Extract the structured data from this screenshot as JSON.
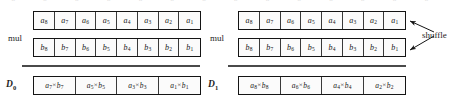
{
  "figure": {
    "ghost_text": "a b a b a b a b a b a b a b",
    "panels": [
      {
        "id": "left",
        "mul_label": "mul",
        "result_label": "D",
        "result_label_sub": "0",
        "operand_rows": [
          {
            "name": "operand-a",
            "cells": [
              {
                "base": "a",
                "sub": "8"
              },
              {
                "base": "a",
                "sub": "7"
              },
              {
                "base": "a",
                "sub": "6"
              },
              {
                "base": "a",
                "sub": "5"
              },
              {
                "base": "a",
                "sub": "4"
              },
              {
                "base": "a",
                "sub": "3"
              },
              {
                "base": "a",
                "sub": "2"
              },
              {
                "base": "a",
                "sub": "1"
              }
            ]
          },
          {
            "name": "operand-b",
            "cells": [
              {
                "base": "b",
                "sub": "8"
              },
              {
                "base": "b",
                "sub": "7"
              },
              {
                "base": "b",
                "sub": "6"
              },
              {
                "base": "b",
                "sub": "5"
              },
              {
                "base": "b",
                "sub": "4"
              },
              {
                "base": "b",
                "sub": "3"
              },
              {
                "base": "b",
                "sub": "2"
              },
              {
                "base": "b",
                "sub": "1"
              }
            ]
          }
        ],
        "result_cells": [
          {
            "left": "a",
            "left_sub": "7",
            "op": "×",
            "right": "b",
            "right_sub": "7"
          },
          {
            "left": "a",
            "left_sub": "5",
            "op": "×",
            "right": "b",
            "right_sub": "5"
          },
          {
            "left": "a",
            "left_sub": "3",
            "op": "×",
            "right": "b",
            "right_sub": "3"
          },
          {
            "left": "a",
            "left_sub": "1",
            "op": "×",
            "right": "b",
            "right_sub": "1"
          }
        ]
      },
      {
        "id": "right",
        "mul_label": "mul",
        "result_label": "D",
        "result_label_sub": "1",
        "annotation": "shuffle",
        "operand_rows": [
          {
            "name": "operand-a",
            "cells": [
              {
                "base": "a",
                "sub": "8"
              },
              {
                "base": "a",
                "sub": "7"
              },
              {
                "base": "a",
                "sub": "6"
              },
              {
                "base": "a",
                "sub": "5"
              },
              {
                "base": "a",
                "sub": "4"
              },
              {
                "base": "a",
                "sub": "3"
              },
              {
                "base": "a",
                "sub": "2"
              },
              {
                "base": "a",
                "sub": "1"
              }
            ]
          },
          {
            "name": "operand-b",
            "cells": [
              {
                "base": "b",
                "sub": "8"
              },
              {
                "base": "b",
                "sub": "7"
              },
              {
                "base": "b",
                "sub": "6"
              },
              {
                "base": "b",
                "sub": "5"
              },
              {
                "base": "b",
                "sub": "4"
              },
              {
                "base": "b",
                "sub": "3"
              },
              {
                "base": "b",
                "sub": "2"
              },
              {
                "base": "b",
                "sub": "1"
              }
            ]
          }
        ],
        "result_cells": [
          {
            "left": "a",
            "left_sub": "8",
            "op": "×",
            "right": "b",
            "right_sub": "8"
          },
          {
            "left": "a",
            "left_sub": "6",
            "op": "×",
            "right": "b",
            "right_sub": "6"
          },
          {
            "left": "a",
            "left_sub": "4",
            "op": "×",
            "right": "b",
            "right_sub": "4"
          },
          {
            "left": "a",
            "left_sub": "2",
            "op": "×",
            "right": "b",
            "right_sub": "2"
          }
        ]
      }
    ],
    "colors": {
      "ink": "#141414",
      "cell_border": "#3a3a3a",
      "rule": "#4a4a4a",
      "background": "#ffffff"
    }
  }
}
